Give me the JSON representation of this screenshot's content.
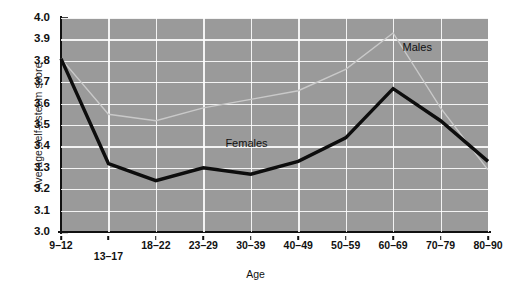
{
  "chart_data": {
    "type": "line",
    "title": "",
    "xlabel": "Age",
    "ylabel": "Average self-esteem score",
    "categories": [
      "9–12",
      "13–17",
      "18–22",
      "23–29",
      "30–39",
      "40–49",
      "50–59",
      "60–69",
      "70–79",
      "80–90"
    ],
    "ylim": [
      3.0,
      4.0
    ],
    "ytick_step": 0.1,
    "yticks": [
      "3.0",
      "3.1",
      "3.2",
      "3.3",
      "3.4",
      "3.5",
      "3.6",
      "3.7",
      "3.8",
      "3.9",
      "4.0"
    ],
    "grid": "both",
    "legend_position": "inline-annotations",
    "series": [
      {
        "name": "Males",
        "color": "#c9c9c9",
        "linewidth": 1.4,
        "values": [
          3.81,
          3.55,
          3.52,
          3.58,
          3.62,
          3.66,
          3.76,
          3.93,
          3.58,
          3.29
        ],
        "label_x_frac": 0.8,
        "label_y_value": 3.86
      },
      {
        "name": "Females",
        "color": "#0d0d0d",
        "linewidth": 3.4,
        "values": [
          3.81,
          3.32,
          3.24,
          3.3,
          3.27,
          3.33,
          3.44,
          3.67,
          3.52,
          3.33
        ],
        "label_x_frac": 0.385,
        "label_y_value": 3.41
      }
    ],
    "plot_background": "#9a9a9a",
    "grid_color": "#ffffff",
    "axis_color": "#111111",
    "staggered_xlabels": [
      1
    ]
  }
}
